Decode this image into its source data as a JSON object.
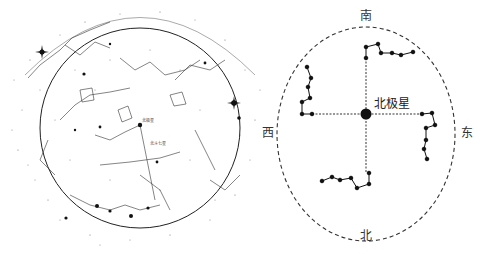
{
  "figure": {
    "left_panel": {
      "title": "",
      "description": "northern sky star chart",
      "bright_star_labels": [
        "北极星",
        "北斗七星"
      ],
      "circle": {
        "cx": 140,
        "cy": 128,
        "r": 100
      }
    },
    "right_panel": {
      "center_label": "北极星",
      "directions": {
        "top": "南",
        "bottom": "北",
        "left": "西",
        "right": "东"
      },
      "circle": {
        "cx": 96,
        "cy": 134,
        "rx": 88,
        "ry": 108
      },
      "center": {
        "x": 96,
        "y": 114
      },
      "dippers": [
        {
          "name": "south",
          "points": [
            [
              96,
              58
            ],
            [
              96,
              47
            ],
            [
              108,
              44
            ],
            [
              111,
              53
            ],
            [
              122,
              53
            ],
            [
              131,
              55
            ],
            [
              143,
              52
            ]
          ]
        },
        {
          "name": "west",
          "points": [
            [
              42,
              114
            ],
            [
              32,
              114
            ],
            [
              32,
              102
            ],
            [
              40,
              98
            ],
            [
              38,
              87
            ],
            [
              41,
              78
            ],
            [
              37,
              67
            ]
          ]
        },
        {
          "name": "east",
          "points": [
            [
              152,
              114
            ],
            [
              162,
              113
            ],
            [
              165,
              125
            ],
            [
              156,
              128
            ],
            [
              156,
              140
            ],
            [
              154,
              149
            ],
            [
              157,
              159
            ]
          ]
        },
        {
          "name": "north",
          "points": [
            [
              99,
              173
            ],
            [
              99,
              184
            ],
            [
              87,
              188
            ],
            [
              81,
              178
            ],
            [
              70,
              180
            ],
            [
              62,
              177
            ],
            [
              52,
              181
            ]
          ]
        }
      ]
    }
  },
  "colors": {
    "ink": "#1a1a1a",
    "background": "#ffffff",
    "dashed": "#333333"
  }
}
